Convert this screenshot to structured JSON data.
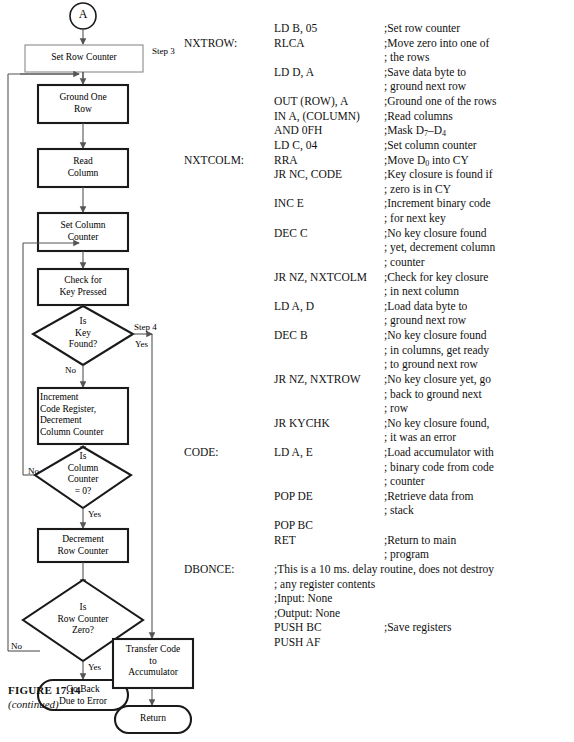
{
  "figure": {
    "title": "FIGURE 17.14",
    "subtitle": "(continued)"
  },
  "flowchart": {
    "type": "flowchart",
    "connector_label": "A",
    "nodes": [
      {
        "id": "set-row-counter",
        "shape": "process-thin",
        "text": "Set Row Counter"
      },
      {
        "id": "ground-one-row",
        "shape": "process",
        "text": "Ground One\nRow"
      },
      {
        "id": "read-column",
        "shape": "process",
        "text": "Read\nColumn"
      },
      {
        "id": "set-column-counter",
        "shape": "process",
        "text": "Set Column\nCounter"
      },
      {
        "id": "check-for-key-pressed",
        "shape": "process",
        "text": "Check for\nKey Pressed"
      },
      {
        "id": "is-key-found",
        "shape": "decision",
        "text": "Is\nKey\nFound?"
      },
      {
        "id": "increment-code-register",
        "shape": "process",
        "text": "Increment\nCode Register,\nDecrement\nColumn Counter"
      },
      {
        "id": "is-column-counter-zero",
        "shape": "decision",
        "text": "Is\nColumn\nCounter\n= 0?"
      },
      {
        "id": "decrement-row-counter",
        "shape": "process",
        "text": "Decrement\nRow Counter"
      },
      {
        "id": "is-row-counter-zero",
        "shape": "decision",
        "text": "Is\nRow Counter\nZero?"
      },
      {
        "id": "go-back-due-to-error",
        "shape": "terminator",
        "text": "Go Back\nDue to Error"
      },
      {
        "id": "transfer-code",
        "shape": "process",
        "text": "Transfer Code\nto\nAccumulator"
      },
      {
        "id": "return",
        "shape": "terminator",
        "text": "Return"
      }
    ],
    "annotations": [
      {
        "id": "step-3",
        "text": "Step 3"
      },
      {
        "id": "step-4",
        "text": "Step 4"
      }
    ],
    "branch_labels": {
      "key_found_yes": "Yes",
      "key_found_no": "No",
      "column_counter_no": "No",
      "column_counter_yes": "Yes",
      "row_counter_no": "No",
      "row_counter_yes": "Yes"
    }
  },
  "listing": {
    "rows": [
      {
        "label": "",
        "mnemonic": "LD B, 05",
        "comment": ";Set row counter",
        "wide": false
      },
      {
        "label": "NXTROW:",
        "mnemonic": "RLCA",
        "comment": ";Move zero into one of",
        "wide": false
      },
      {
        "label": "",
        "mnemonic": "",
        "comment": "; the rows",
        "wide": false
      },
      {
        "label": "",
        "mnemonic": "LD D, A",
        "comment": ";Save data byte to",
        "wide": false
      },
      {
        "label": "",
        "mnemonic": "",
        "comment": "; ground next row",
        "wide": false
      },
      {
        "label": "",
        "mnemonic": "OUT (ROW), A",
        "comment": ";Ground one of the rows",
        "wide": true
      },
      {
        "label": "",
        "mnemonic": "IN A, (COLUMN)",
        "comment": ";Read columns",
        "wide": false
      },
      {
        "label": "",
        "mnemonic": "AND 0FH",
        "comment": ";Mask D7-D4",
        "wide": false,
        "sub": "mask"
      },
      {
        "label": "",
        "mnemonic": "LD C, 04",
        "comment": ";Set column counter",
        "wide": false
      },
      {
        "label": "NXTCOLM:",
        "mnemonic": "RRA",
        "comment": ";Move D0 into CY",
        "wide": false,
        "sub": "rra"
      },
      {
        "label": "",
        "mnemonic": "JR NC, CODE",
        "comment": ";Key closure is found if",
        "wide": false
      },
      {
        "label": "",
        "mnemonic": "",
        "comment": "; zero is in CY",
        "wide": false
      },
      {
        "label": "",
        "mnemonic": "INC E",
        "comment": ";Increment binary code",
        "wide": false
      },
      {
        "label": "",
        "mnemonic": "",
        "comment": "; for next key",
        "wide": false
      },
      {
        "label": "",
        "mnemonic": "DEC C",
        "comment": ";No key closure found",
        "wide": false
      },
      {
        "label": "",
        "mnemonic": "",
        "comment": "; yet, decrement column",
        "wide": false
      },
      {
        "label": "",
        "mnemonic": "",
        "comment": "; counter",
        "wide": false
      },
      {
        "label": "",
        "mnemonic": "JR NZ, NXTCOLM",
        "comment": ";Check for key closure",
        "wide": false
      },
      {
        "label": "",
        "mnemonic": "",
        "comment": "; in next column",
        "wide": false
      },
      {
        "label": "",
        "mnemonic": "LD A, D",
        "comment": ";Load data byte to",
        "wide": false
      },
      {
        "label": "",
        "mnemonic": "",
        "comment": "; ground next row",
        "wide": false
      },
      {
        "label": "",
        "mnemonic": "DEC B",
        "comment": ";No key closure found",
        "wide": false
      },
      {
        "label": "",
        "mnemonic": "",
        "comment": "; in columns, get ready",
        "wide": false
      },
      {
        "label": "",
        "mnemonic": "",
        "comment": "; to ground next row",
        "wide": false
      },
      {
        "label": "",
        "mnemonic": "JR NZ, NXTROW",
        "comment": ";No key closure yet, go",
        "wide": false
      },
      {
        "label": "",
        "mnemonic": "",
        "comment": "; back to ground next",
        "wide": false
      },
      {
        "label": "",
        "mnemonic": "",
        "comment": "; row",
        "wide": false
      },
      {
        "label": "",
        "mnemonic": "JR KYCHK",
        "comment": ";No key closure found,",
        "wide": false
      },
      {
        "label": "",
        "mnemonic": "",
        "comment": "; it was an error",
        "wide": false
      },
      {
        "label": "CODE:",
        "mnemonic": "LD A, E",
        "comment": ";Load accumulator with",
        "wide": false
      },
      {
        "label": "",
        "mnemonic": "",
        "comment": "; binary code from code",
        "wide": false
      },
      {
        "label": "",
        "mnemonic": "",
        "comment": "; counter",
        "wide": false
      },
      {
        "label": "",
        "mnemonic": "POP DE",
        "comment": ";Retrieve data from",
        "wide": false
      },
      {
        "label": "",
        "mnemonic": "",
        "comment": "; stack",
        "wide": false
      },
      {
        "label": "",
        "mnemonic": "POP BC",
        "comment": "",
        "wide": false
      },
      {
        "label": "",
        "mnemonic": "RET",
        "comment": ";Return to main",
        "wide": false
      },
      {
        "label": "",
        "mnemonic": "",
        "comment": "; program",
        "wide": false
      },
      {
        "label": "DBONCE:",
        "mnemonic": ";This is a 10 ms. delay routine, does not destroy",
        "comment": "",
        "wide": false,
        "span": true
      },
      {
        "label": "",
        "mnemonic": "; any register contents",
        "comment": "",
        "wide": false,
        "span": true
      },
      {
        "label": "",
        "mnemonic": ";Input: None",
        "comment": "",
        "wide": false,
        "span": true
      },
      {
        "label": "",
        "mnemonic": ";Output: None",
        "comment": "",
        "wide": false,
        "span": true
      },
      {
        "label": "",
        "mnemonic": "PUSH BC",
        "comment": ";Save registers",
        "wide": false
      },
      {
        "label": "",
        "mnemonic": "PUSH AF",
        "comment": "",
        "wide": false
      }
    ]
  }
}
